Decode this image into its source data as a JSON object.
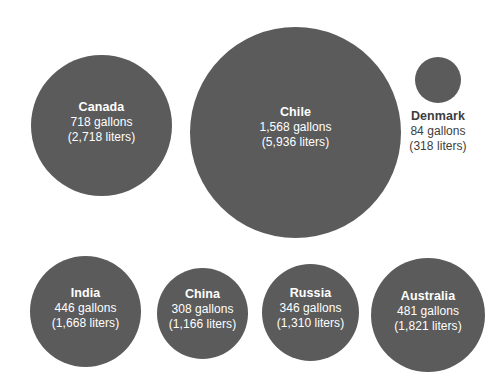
{
  "chart_data": {
    "type": "bubble",
    "title": "",
    "xlabel": "",
    "ylabel": "",
    "value_unit": "gallons",
    "secondary_unit": "liters",
    "legend_position": "none",
    "grid": false,
    "bubble_color": "#5b5b5b",
    "background_color": "#ffffff",
    "inside_label_color": "#ffffff",
    "outside_label_color": "#3d3d3d",
    "categories": [
      "Canada",
      "Chile",
      "Denmark",
      "India",
      "China",
      "Russia",
      "Australia"
    ],
    "values": [
      718,
      1568,
      84,
      446,
      308,
      346,
      481
    ],
    "values_liters": [
      2718,
      5936,
      318,
      1668,
      1310,
      1821
    ],
    "series": [
      {
        "name": "Water footprint per capita",
        "values": [
          718,
          1568,
          84,
          446,
          308,
          346,
          481
        ]
      }
    ],
    "points": [
      {
        "name": "Canada",
        "gallons": 718,
        "liters": 2718,
        "gallons_label": "718 gallons",
        "liters_label": "(2,718 liters)",
        "label_placement": "inside"
      },
      {
        "name": "Chile",
        "gallons": 1568,
        "liters": 5936,
        "gallons_label": "1,568 gallons",
        "liters_label": "(5,936 liters)",
        "label_placement": "inside"
      },
      {
        "name": "Denmark",
        "gallons": 84,
        "liters": 318,
        "gallons_label": "84 gallons",
        "liters_label": "(318 liters)",
        "label_placement": "outside"
      },
      {
        "name": "India",
        "gallons": 446,
        "liters": 1668,
        "gallons_label": "446 gallons",
        "liters_label": "(1,668 liters)",
        "label_placement": "inside"
      },
      {
        "name": "China",
        "gallons": 308,
        "liters": 1166,
        "gallons_label": "308 gallons",
        "liters_label": "(1,166 liters)",
        "label_placement": "inside"
      },
      {
        "name": "Russia",
        "gallons": 346,
        "liters": 1310,
        "gallons_label": "346 gallons",
        "liters_label": "(1,310 liters)",
        "label_placement": "inside"
      },
      {
        "name": "Australia",
        "gallons": 481,
        "liters": 1821,
        "gallons_label": "481 gallons",
        "liters_label": "(1,821 liters)",
        "label_placement": "inside"
      }
    ]
  },
  "bubbles": {
    "canada": {
      "name": "Canada",
      "gallons_label": "718 gallons",
      "liters_label": "(2,718 liters)"
    },
    "chile": {
      "name": "Chile",
      "gallons_label": "1,568 gallons",
      "liters_label": "(5,936 liters)"
    },
    "denmark": {
      "name": "Denmark",
      "gallons_label": "84 gallons",
      "liters_label": "(318 liters)"
    },
    "india": {
      "name": "India",
      "gallons_label": "446 gallons",
      "liters_label": "(1,668 liters)"
    },
    "china": {
      "name": "China",
      "gallons_label": "308 gallons",
      "liters_label": "(1,166 liters)"
    },
    "russia": {
      "name": "Russia",
      "gallons_label": "346 gallons",
      "liters_label": "(1,310 liters)"
    },
    "australia": {
      "name": "Australia",
      "gallons_label": "481 gallons",
      "liters_label": "(1,821 liters)"
    }
  }
}
